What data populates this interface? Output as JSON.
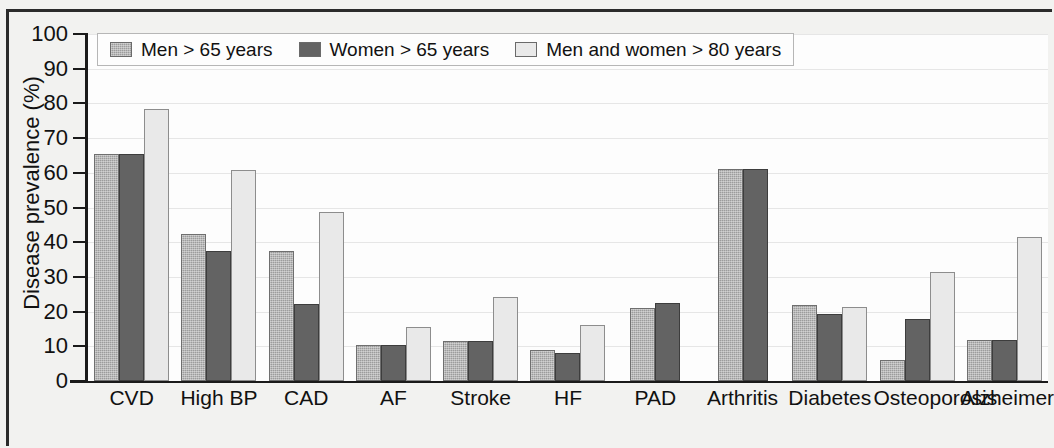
{
  "chart_data": {
    "type": "bar",
    "title": "",
    "xlabel": "",
    "ylabel": "Disease prevalence (%)",
    "ylim": [
      0,
      100
    ],
    "ytick_labels": [
      "100",
      "90",
      "80",
      "70",
      "60",
      "50",
      "40",
      "30",
      "20",
      "10",
      "0"
    ],
    "yticks": [
      100,
      90,
      80,
      70,
      60,
      50,
      40,
      30,
      20,
      10,
      0
    ],
    "grid": true,
    "legend_position": "top-left inside plot",
    "categories": [
      "CVD",
      "High BP",
      "CAD",
      "AF",
      "Stroke",
      "HF",
      "PAD",
      "Arthritis",
      "Diabetes",
      "Osteoporosis",
      "Alzheimer's"
    ],
    "series": [
      {
        "name": "Men > 65 years",
        "color": "#9c9c9c",
        "values": [
          65.5,
          42.5,
          37.5,
          10.5,
          11.5,
          9.0,
          21.0,
          61.0,
          22.0,
          6.0,
          11.8
        ]
      },
      {
        "name": "Women > 65 years",
        "color": "#636363",
        "values": [
          65.5,
          37.5,
          22.3,
          10.5,
          11.5,
          8.2,
          22.5,
          61.0,
          19.3,
          18.0,
          11.8
        ]
      },
      {
        "name": "Men and women > 80 years",
        "color": "#e9e9e9",
        "values": [
          78.5,
          60.8,
          48.8,
          15.7,
          24.3,
          16.2,
          null,
          null,
          21.3,
          31.5,
          41.5
        ]
      }
    ]
  },
  "legend": {
    "items": [
      {
        "label": "Men > 65 years",
        "color": "#9c9c9c"
      },
      {
        "label": "Women > 65 years",
        "color": "#636363"
      },
      {
        "label": "Men and women > 80 years",
        "color": "#e9e9e9"
      }
    ]
  }
}
